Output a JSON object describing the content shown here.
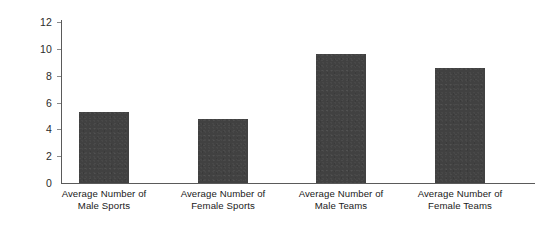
{
  "chart_data": {
    "type": "bar",
    "title": "",
    "subtitle": "",
    "xlabel": "",
    "ylabel": "",
    "categories": [
      "Average Number of Male Sports",
      "Average Number of Female Sports",
      "Average Number of Male Teams",
      "Average Number of Female Teams"
    ],
    "category_lines": [
      [
        "Average Number of",
        "Male Sports"
      ],
      [
        "Average Number of",
        "Female Sports"
      ],
      [
        "Average Number of",
        "Male Teams"
      ],
      [
        "Average Number of",
        "Female Teams"
      ]
    ],
    "values": [
      5.3,
      4.8,
      9.65,
      8.6
    ],
    "ylim": [
      0,
      12
    ],
    "yticks": [
      0,
      2,
      4,
      6,
      8,
      10,
      12
    ],
    "ytick_labels": [
      "0",
      "2",
      "4",
      "6",
      "8",
      "10",
      "12"
    ],
    "grid": false,
    "legend": false,
    "legend_position": "none",
    "bar_color": "#414141",
    "axis_color": "#5a5a5a",
    "text_color": "#1a1a1a",
    "background_color": "#ffffff"
  }
}
